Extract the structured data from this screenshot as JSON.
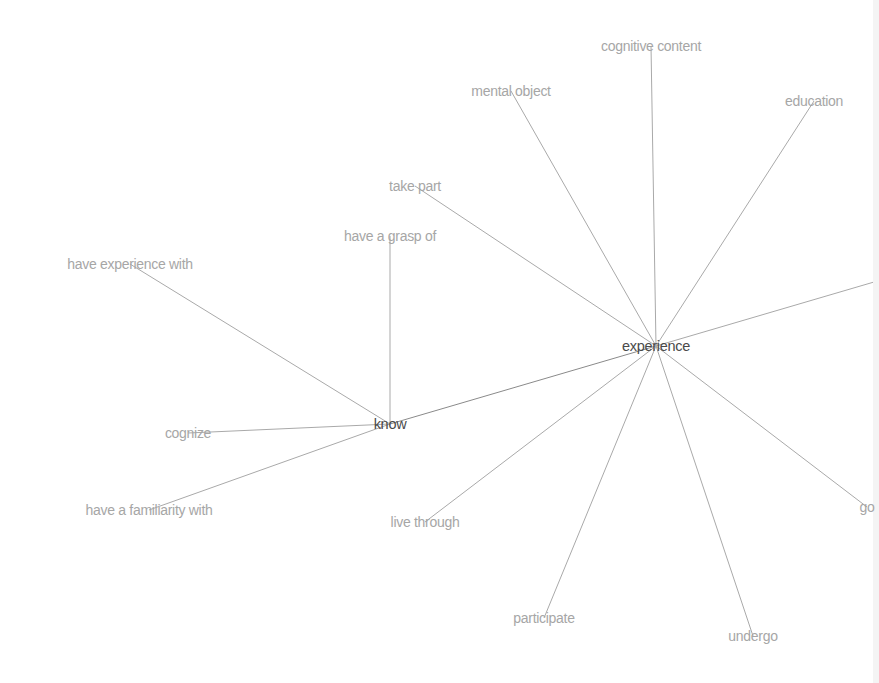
{
  "graph": {
    "type": "word-network",
    "edge_color": "#a9a9a9",
    "hub_color": "#4a4a4a",
    "leaf_color": "#a6a6a6",
    "nodes": [
      {
        "id": "experience",
        "label": "experience",
        "x": 656,
        "y": 346,
        "hub": true
      },
      {
        "id": "know",
        "label": "know",
        "x": 390,
        "y": 424,
        "hub": true
      },
      {
        "id": "cognitive-content",
        "label": "cognitive content",
        "x": 651,
        "y": 46,
        "hub": false
      },
      {
        "id": "mental-object",
        "label": "mental object",
        "x": 511,
        "y": 91,
        "hub": false
      },
      {
        "id": "education",
        "label": "education",
        "x": 814,
        "y": 101,
        "hub": false
      },
      {
        "id": "take-part",
        "label": "take part",
        "x": 415,
        "y": 186,
        "hub": false
      },
      {
        "id": "have-a-grasp-of",
        "label": "have a grasp of",
        "x": 390,
        "y": 236,
        "hub": false
      },
      {
        "id": "have-experience-with",
        "label": "have experience with",
        "x": 130,
        "y": 264,
        "hub": false
      },
      {
        "id": "cognize",
        "label": "cognize",
        "x": 188,
        "y": 433,
        "hub": false
      },
      {
        "id": "have-a-familiarity-with",
        "label": "have a familiarity with",
        "x": 149,
        "y": 510,
        "hub": false
      },
      {
        "id": "live-through",
        "label": "live through",
        "x": 425,
        "y": 522,
        "hub": false
      },
      {
        "id": "participate",
        "label": "participate",
        "x": 544,
        "y": 618,
        "hub": false
      },
      {
        "id": "undergo",
        "label": "undergo",
        "x": 753,
        "y": 636,
        "hub": false
      },
      {
        "id": "go",
        "label": "go",
        "x": 867,
        "y": 507,
        "hub": false
      },
      {
        "id": "offscreen-right",
        "label": "",
        "x": 874,
        "y": 282,
        "hub": false
      }
    ],
    "edges": [
      {
        "from": "know",
        "to": "experience"
      },
      {
        "from": "experience",
        "to": "cognitive-content"
      },
      {
        "from": "experience",
        "to": "mental-object"
      },
      {
        "from": "experience",
        "to": "education"
      },
      {
        "from": "experience",
        "to": "take-part"
      },
      {
        "from": "experience",
        "to": "offscreen-right"
      },
      {
        "from": "experience",
        "to": "go"
      },
      {
        "from": "experience",
        "to": "undergo"
      },
      {
        "from": "experience",
        "to": "participate"
      },
      {
        "from": "experience",
        "to": "live-through"
      },
      {
        "from": "know",
        "to": "have-a-grasp-of"
      },
      {
        "from": "know",
        "to": "have-experience-with"
      },
      {
        "from": "know",
        "to": "cognize"
      },
      {
        "from": "know",
        "to": "have-a-familiarity-with"
      }
    ]
  },
  "labels": {
    "experience": "experience",
    "know": "know",
    "cognitive_content": "cognitive content",
    "mental_object": "mental object",
    "education": "education",
    "take_part": "take part",
    "have_a_grasp_of": "have a grasp of",
    "have_experience_with": "have experience with",
    "cognize": "cognize",
    "have_a_familiarity_with": "have a familiarity with",
    "live_through": "live through",
    "participate": "participate",
    "undergo": "undergo",
    "go": "go"
  }
}
